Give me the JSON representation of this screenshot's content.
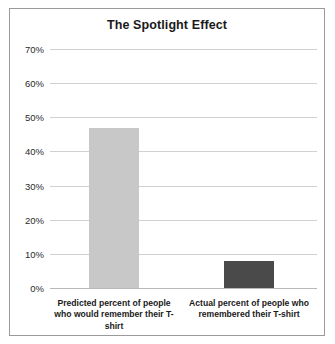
{
  "chart_data": {
    "type": "bar",
    "title": "The Spotlight Effect",
    "xlabel": "",
    "ylabel": "",
    "ylim": [
      0,
      70
    ],
    "ytick_values": [
      70,
      60,
      50,
      40,
      30,
      20,
      10,
      0
    ],
    "ytick_labels": [
      "70%",
      "60%",
      "50%",
      "40%",
      "30%",
      "20%",
      "10%",
      "0%"
    ],
    "grid": true,
    "legend": false,
    "categories": [
      "Predicted percent of people who would remember their T-shirt",
      "Actual percent of people who remembered their T-shirt"
    ],
    "values": [
      47,
      8
    ],
    "bar_colors": [
      "#c8c8c8",
      "#4a4a4a"
    ]
  },
  "style": {
    "frame_border_color": "#9a9a9a",
    "gridline_color": "#d0d0d0",
    "background": "#ffffff",
    "title_color": "#1a1a1a",
    "tick_color": "#2b2b2b"
  }
}
